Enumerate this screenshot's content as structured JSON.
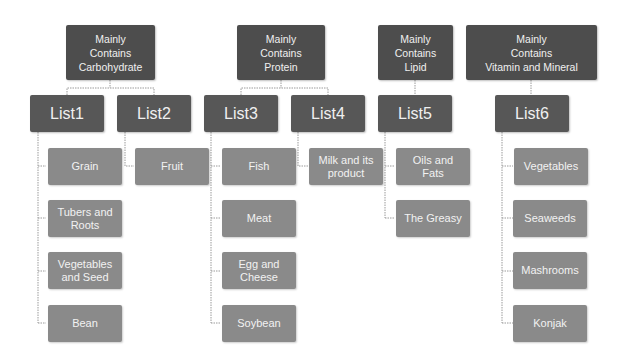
{
  "diagram": {
    "categories": [
      {
        "label": "Mainly Contains Carbohydrate",
        "line1": "Mainly",
        "line2": "Contains",
        "line3": "Carbohydrate"
      },
      {
        "label": "Mainly Contains Protein",
        "line1": "Mainly",
        "line2": "Contains",
        "line3": "Protein"
      },
      {
        "label": "Mainly Contains Lipid",
        "line1": "Mainly",
        "line2": "Contains",
        "line3": "Lipid"
      },
      {
        "label": "Mainly Contains Vitamin and Mineral",
        "line1": "Mainly",
        "line2": "Contains",
        "line3": "Vitamin and Mineral"
      }
    ],
    "lists": [
      {
        "label": "List1",
        "items": [
          "Grain",
          "Tubers and Roots",
          "Vegetables and Seed",
          "Bean"
        ]
      },
      {
        "label": "List2",
        "items": [
          "Fruit"
        ]
      },
      {
        "label": "List3",
        "items": [
          "Fish",
          "Meat",
          "Egg and Cheese",
          "Soybean"
        ]
      },
      {
        "label": "List4",
        "items": [
          "Milk and its product"
        ]
      },
      {
        "label": "List5",
        "items": [
          "Oils and Fats",
          "The Greasy"
        ]
      },
      {
        "label": "List6",
        "items": [
          "Vegetables",
          "Seaweeds",
          "Mashrooms",
          "Konjak"
        ]
      }
    ]
  },
  "colors": {
    "category_box": "#4d4d4d",
    "list_box": "#575757",
    "item_box": "#8a8a8a",
    "connector": "#9a9a9a"
  }
}
